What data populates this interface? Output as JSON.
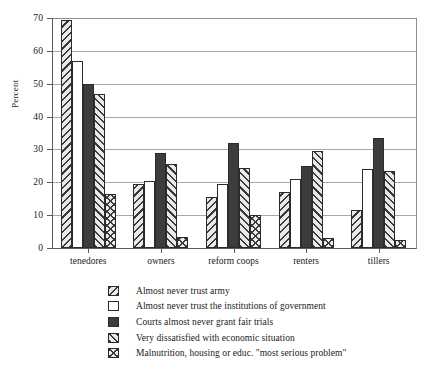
{
  "chart_data": {
    "type": "bar",
    "title": "",
    "xlabel": "",
    "ylabel": "Percent",
    "ylim": [
      0,
      70
    ],
    "ytick_values": [
      0,
      10,
      20,
      30,
      40,
      50,
      60,
      70
    ],
    "ytick_labels": [
      "0",
      "10",
      "20",
      "30",
      "40",
      "50",
      "60",
      "70"
    ],
    "grid": true,
    "legend_position": "below",
    "categories": [
      "tenedores",
      "owners",
      "reform coops",
      "renters",
      "tillers"
    ],
    "series": [
      {
        "name": "Almost never trust army",
        "pattern": "backslash-hatch",
        "values": [
          69.5,
          19.5,
          15.5,
          17.0,
          11.5
        ]
      },
      {
        "name": "Almost never trust the institutions of government",
        "pattern": "empty-white",
        "values": [
          57.0,
          20.5,
          19.5,
          21.0,
          24.0
        ]
      },
      {
        "name": "Courts almost never grant fair trials",
        "pattern": "solid-dark",
        "values": [
          50.0,
          29.0,
          32.0,
          25.0,
          33.5
        ]
      },
      {
        "name": "Very dissatisfied with economic situation",
        "pattern": "forwardslash-hatch",
        "values": [
          47.0,
          25.5,
          24.5,
          29.5,
          23.5
        ]
      },
      {
        "name": "Malnutrition, housing or educ. \"most serious problem\"",
        "pattern": "cross-hatch",
        "values": [
          16.5,
          3.5,
          10.0,
          3.0,
          2.5
        ]
      }
    ]
  },
  "colors": {
    "hatch": "#3a3a3a",
    "hatch_background": "#e9e9e9",
    "solid_fill": "#3d3d3d",
    "empty_fill": "#ffffff",
    "bar_outline": "#2b2b2b",
    "gridline": "#a8a8a8",
    "axis": "#5a5a5a",
    "text": "#1a1a1a",
    "page_background": "#ffffff"
  }
}
